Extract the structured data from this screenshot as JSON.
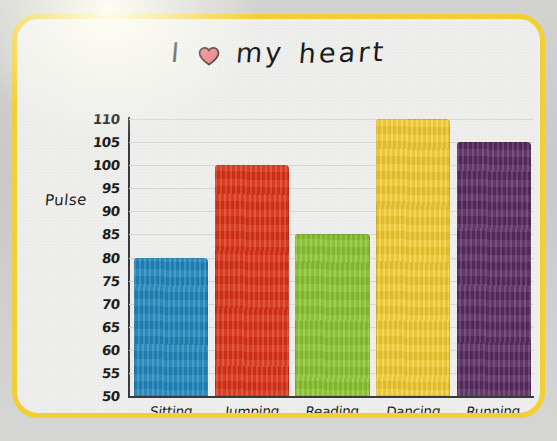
{
  "frame": {
    "border_color": "#f2cf33",
    "paper_color": "#efefed",
    "backdrop_color": "#cfcfcd"
  },
  "title": {
    "word_before": "I",
    "icon": "heart-icon",
    "icon_color": "#e8757a",
    "icon_outline": "#3a2222",
    "word_mid": "my",
    "word_after": "heart"
  },
  "chart_data": {
    "type": "bar",
    "xlabel": "",
    "ylabel": "Pulse",
    "categories": [
      "Sitting",
      "Jumping",
      "Reading",
      "Dancing",
      "Running"
    ],
    "values": [
      80,
      100,
      85,
      110,
      105
    ],
    "colors": [
      "#2189be",
      "#de3418",
      "#8cc631",
      "#f5ce32",
      "#5b2d63"
    ],
    "ylim": [
      50,
      110
    ],
    "ytick_step": 5,
    "yticks": [
      110,
      105,
      100,
      95,
      90,
      85,
      80,
      75,
      70,
      65,
      60,
      55,
      50
    ],
    "ytick_labels": [
      "110",
      "105",
      "100",
      "95",
      "90",
      "85",
      "80",
      "75",
      "70",
      "65",
      "60",
      "55",
      "50"
    ],
    "grid": true,
    "legend": false,
    "series": [
      {
        "name": "Pulse",
        "points": [
          {
            "category": "Sitting",
            "value": 80,
            "color": "#2189be"
          },
          {
            "category": "Jumping",
            "value": 100,
            "color": "#de3418"
          },
          {
            "category": "Reading",
            "value": 85,
            "color": "#8cc631"
          },
          {
            "category": "Dancing",
            "value": 110,
            "color": "#f5ce32"
          },
          {
            "category": "Running",
            "value": 105,
            "color": "#5b2d63"
          }
        ]
      }
    ]
  }
}
